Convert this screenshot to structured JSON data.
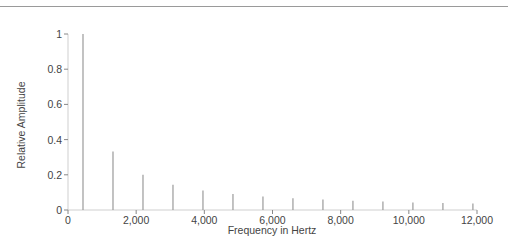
{
  "header": {
    "cut_off_text": "p y p g p"
  },
  "chart_data": {
    "type": "bar",
    "title": "",
    "xlabel": "Frequency in Hertz",
    "ylabel": "Relative Amplitude",
    "xlim": [
      0,
      12000
    ],
    "ylim": [
      0,
      1
    ],
    "grid": false,
    "legend": null,
    "x_ticks": [
      0,
      2000,
      4000,
      6000,
      8000,
      10000,
      12000
    ],
    "x_tick_labels": [
      "0",
      "2,000",
      "4,000",
      "6,000",
      "8,000",
      "10,000",
      "12,000"
    ],
    "y_ticks": [
      0,
      0.2,
      0.4,
      0.6,
      0.8,
      1
    ],
    "y_tick_labels": [
      "0",
      "0.2",
      "0.4",
      "0.6",
      "0.8",
      "1"
    ],
    "x": [
      440,
      1320,
      2200,
      3080,
      3960,
      4840,
      5720,
      6600,
      7480,
      8360,
      9240,
      10120,
      11000,
      11880
    ],
    "values": [
      1.0,
      0.333,
      0.2,
      0.143,
      0.111,
      0.091,
      0.077,
      0.067,
      0.059,
      0.053,
      0.048,
      0.043,
      0.04,
      0.037
    ],
    "colors": {
      "bars": "#9a9a9a",
      "axis": "#cfcfcf",
      "text": "#444444"
    }
  }
}
